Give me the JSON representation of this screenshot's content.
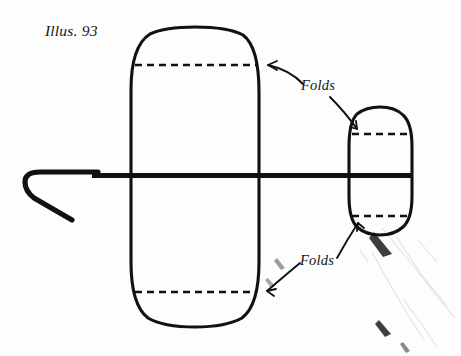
{
  "figure": {
    "caption": "Illus. 93",
    "labels": {
      "folds_upper": "Folds",
      "folds_lower": "Folds"
    },
    "colors": {
      "ink": "#111111",
      "paper": "#fdfdfd",
      "smudge": "#d8d8d8"
    },
    "icon_names": {
      "hook": "hook-icon",
      "large_loop": "large-fabric-loop-icon",
      "small_loop": "small-fabric-loop-icon",
      "rod": "horizontal-rod-icon",
      "fold_line": "fold-dashed-line-icon",
      "arrow": "leader-arrow-icon"
    },
    "parts": [
      {
        "name": "hook",
        "label": ""
      },
      {
        "name": "large-loop",
        "label": ""
      },
      {
        "name": "small-loop",
        "label": ""
      },
      {
        "name": "rod",
        "label": ""
      },
      {
        "name": "fold-line-large-top",
        "label": ""
      },
      {
        "name": "fold-line-large-bottom",
        "label": ""
      },
      {
        "name": "fold-line-small-top",
        "label": ""
      },
      {
        "name": "fold-line-small-bottom",
        "label": ""
      }
    ]
  }
}
